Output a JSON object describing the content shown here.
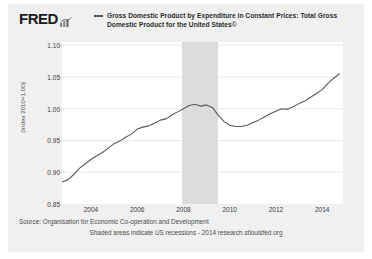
{
  "header": {
    "logo_text": "FRED",
    "logo_glyph": "bar-chart-icon"
  },
  "legend": {
    "series_label": "Gross Domestic Product by Expenditure in Constant Prices: Total Gross Domestic Product for the United States©",
    "line_color": "#58585a"
  },
  "footer": {
    "source": "Source: Organisation for Economic Co-operation and Development",
    "note": "Shaded areas indicate US recessions - 2014 research.stlouisfed.org"
  },
  "chart_data": {
    "type": "line",
    "title": "Gross Domestic Product by Expenditure in Constant Prices: Total Gross Domestic Product for the United States©",
    "xlabel": "",
    "ylabel": "(Index 2010=1.00)",
    "xlim": [
      2002.75,
      2014.9
    ],
    "ylim": [
      0.85,
      1.105
    ],
    "yticks": [
      0.85,
      0.9,
      0.95,
      1.0,
      1.05,
      1.1
    ],
    "ytick_labels": [
      "0.85",
      "0.90",
      "0.95",
      "1.00",
      "1.05",
      "1.10"
    ],
    "xticks": [
      2004,
      2006,
      2008,
      2010,
      2012,
      2014
    ],
    "xtick_labels": [
      "2004",
      "2006",
      "2008",
      "2010",
      "2012",
      "2014"
    ],
    "grid": "horizontal",
    "legend_position": "top",
    "line_color": "#58585a",
    "plot_background": "#ffffff",
    "shaded_regions": [
      {
        "label": "US recession",
        "start": 2007.92,
        "end": 2009.5,
        "color": "#dcdcdc"
      }
    ],
    "series": [
      {
        "name": "Real GDP, United States (Index 2010=1.00)",
        "x": [
          2002.75,
          2003.0,
          2003.25,
          2003.5,
          2003.75,
          2004.0,
          2004.25,
          2004.5,
          2004.75,
          2005.0,
          2005.25,
          2005.5,
          2005.75,
          2006.0,
          2006.25,
          2006.5,
          2006.75,
          2007.0,
          2007.25,
          2007.5,
          2007.75,
          2008.0,
          2008.25,
          2008.5,
          2008.75,
          2009.0,
          2009.25,
          2009.5,
          2009.75,
          2010.0,
          2010.25,
          2010.5,
          2010.75,
          2011.0,
          2011.25,
          2011.5,
          2011.75,
          2012.0,
          2012.25,
          2012.5,
          2012.75,
          2013.0,
          2013.25,
          2013.5,
          2013.75,
          2014.0,
          2014.25,
          2014.5,
          2014.75
        ],
        "y": [
          0.885,
          0.888,
          0.896,
          0.906,
          0.913,
          0.92,
          0.926,
          0.931,
          0.938,
          0.945,
          0.949,
          0.955,
          0.96,
          0.968,
          0.971,
          0.973,
          0.977,
          0.982,
          0.984,
          0.99,
          0.995,
          1.0,
          1.005,
          1.007,
          1.004,
          1.006,
          1.002,
          0.99,
          0.98,
          0.974,
          0.972,
          0.972,
          0.974,
          0.978,
          0.982,
          0.987,
          0.992,
          0.996,
          1.0,
          0.999,
          1.003,
          1.008,
          1.012,
          1.018,
          1.024,
          1.03,
          1.04,
          1.048,
          1.055
        ]
      }
    ]
  }
}
